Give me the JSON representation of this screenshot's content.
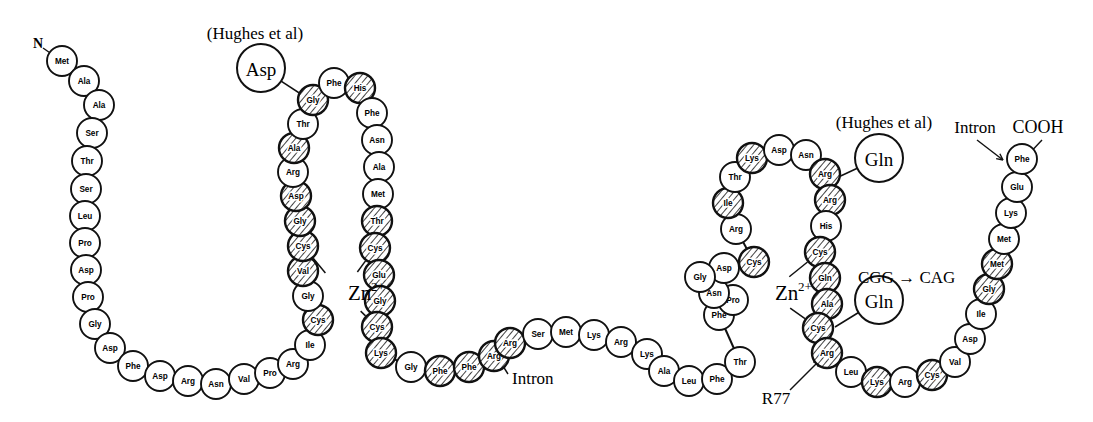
{
  "figure": {
    "colors": {
      "stroke": "#111111",
      "fill_plain": "#ffffff",
      "fill_hatched": "#ffffff",
      "hatch_line": "#111111",
      "text": "#000000"
    },
    "radius_plain": 15,
    "radius_callout": 24
  },
  "terminals": [
    {
      "id": "n-terminus",
      "text": "N",
      "x": 38,
      "y": 43
    },
    {
      "id": "c-terminus",
      "text": "COOH",
      "x": 1038,
      "y": 127
    }
  ],
  "annotations": [
    {
      "id": "hughes-left",
      "text": "(Hughes et al)",
      "x": 255,
      "y": 33,
      "anchor": "middle"
    },
    {
      "id": "hughes-right",
      "text": "(Hughes et al)",
      "x": 884,
      "y": 122,
      "anchor": "middle"
    },
    {
      "id": "zn-left",
      "text": "Zn",
      "sup": "2+",
      "x": 348,
      "y": 293
    },
    {
      "id": "zn-right",
      "text": "Zn",
      "sup": "2+",
      "x": 775,
      "y": 293
    },
    {
      "id": "intron-mid",
      "text": "Intron",
      "x": 512,
      "y": 378,
      "anchor": "start"
    },
    {
      "id": "intron-right",
      "text": "Intron",
      "x": 975,
      "y": 127,
      "anchor": "middle"
    },
    {
      "id": "mutation-cgg-cag",
      "text": "CGG → CAG",
      "x": 858,
      "y": 277,
      "anchor": "start"
    },
    {
      "id": "residue-r77",
      "text": "R77",
      "x": 776,
      "y": 398,
      "anchor": "middle"
    }
  ],
  "callouts": [
    {
      "id": "callout-asp",
      "label": "Asp",
      "x": 261,
      "y": 68,
      "to_x": 310,
      "to_y": 100
    },
    {
      "id": "callout-gln-upper",
      "label": "Gln",
      "x": 879,
      "y": 158,
      "to_x": 832,
      "to_y": 180
    },
    {
      "id": "callout-gln-lower",
      "label": "Gln",
      "x": 879,
      "y": 300,
      "to_x": 835,
      "to_y": 327
    }
  ],
  "chain_name": "zinc-finger-polypeptide",
  "residues": [
    {
      "i": 1,
      "aa": "Met",
      "x": 62,
      "y": 61,
      "hatched": false
    },
    {
      "i": 2,
      "aa": "Ala",
      "x": 84,
      "y": 81,
      "hatched": false
    },
    {
      "i": 3,
      "aa": "Ala",
      "x": 99,
      "y": 105,
      "hatched": false
    },
    {
      "i": 4,
      "aa": "Ser",
      "x": 92,
      "y": 133,
      "hatched": false
    },
    {
      "i": 5,
      "aa": "Thr",
      "x": 87,
      "y": 161,
      "hatched": false
    },
    {
      "i": 6,
      "aa": "Ser",
      "x": 86,
      "y": 189,
      "hatched": false
    },
    {
      "i": 7,
      "aa": "Leu",
      "x": 85,
      "y": 216,
      "hatched": false
    },
    {
      "i": 8,
      "aa": "Pro",
      "x": 85,
      "y": 243,
      "hatched": false
    },
    {
      "i": 9,
      "aa": "Asp",
      "x": 86,
      "y": 270,
      "hatched": false
    },
    {
      "i": 10,
      "aa": "Pro",
      "x": 88,
      "y": 297,
      "hatched": false
    },
    {
      "i": 11,
      "aa": "Gly",
      "x": 95,
      "y": 324,
      "hatched": false
    },
    {
      "i": 12,
      "aa": "Asp",
      "x": 110,
      "y": 348,
      "hatched": false
    },
    {
      "i": 13,
      "aa": "Phe",
      "x": 133,
      "y": 366,
      "hatched": false
    },
    {
      "i": 14,
      "aa": "Asp",
      "x": 160,
      "y": 376,
      "hatched": false
    },
    {
      "i": 15,
      "aa": "Arg",
      "x": 188,
      "y": 381,
      "hatched": false
    },
    {
      "i": 16,
      "aa": "Asn",
      "x": 216,
      "y": 384,
      "hatched": false
    },
    {
      "i": 17,
      "aa": "Val",
      "x": 244,
      "y": 379,
      "hatched": false
    },
    {
      "i": 18,
      "aa": "Pro",
      "x": 270,
      "y": 373,
      "hatched": false
    },
    {
      "i": 19,
      "aa": "Arg",
      "x": 293,
      "y": 364,
      "hatched": false
    },
    {
      "i": 20,
      "aa": "Ile",
      "x": 310,
      "y": 345,
      "hatched": false
    },
    {
      "i": 21,
      "aa": "Cys",
      "x": 318,
      "y": 320,
      "hatched": true
    },
    {
      "i": 22,
      "aa": "Gly",
      "x": 308,
      "y": 296,
      "hatched": false
    },
    {
      "i": 23,
      "aa": "Val",
      "x": 303,
      "y": 271,
      "hatched": true
    },
    {
      "i": 24,
      "aa": "Cys",
      "x": 303,
      "y": 246,
      "hatched": true
    },
    {
      "i": 25,
      "aa": "Gly",
      "x": 300,
      "y": 221,
      "hatched": true
    },
    {
      "i": 26,
      "aa": "Asp",
      "x": 296,
      "y": 196,
      "hatched": true
    },
    {
      "i": 27,
      "aa": "Arg",
      "x": 293,
      "y": 172,
      "hatched": false
    },
    {
      "i": 28,
      "aa": "Ala",
      "x": 294,
      "y": 148,
      "hatched": true
    },
    {
      "i": 29,
      "aa": "Thr",
      "x": 303,
      "y": 124,
      "hatched": false
    },
    {
      "i": 30,
      "aa": "Gly",
      "x": 313,
      "y": 100,
      "hatched": true
    },
    {
      "i": 31,
      "aa": "Phe",
      "x": 334,
      "y": 83,
      "hatched": false
    },
    {
      "i": 32,
      "aa": "His",
      "x": 360,
      "y": 88,
      "hatched": true
    },
    {
      "i": 33,
      "aa": "Phe",
      "x": 372,
      "y": 113,
      "hatched": false
    },
    {
      "i": 34,
      "aa": "Asn",
      "x": 377,
      "y": 140,
      "hatched": false
    },
    {
      "i": 35,
      "aa": "Ala",
      "x": 379,
      "y": 167,
      "hatched": false
    },
    {
      "i": 36,
      "aa": "Met",
      "x": 378,
      "y": 194,
      "hatched": false
    },
    {
      "i": 37,
      "aa": "Thr",
      "x": 377,
      "y": 221,
      "hatched": true
    },
    {
      "i": 38,
      "aa": "Cys",
      "x": 375,
      "y": 248,
      "hatched": true
    },
    {
      "i": 39,
      "aa": "Glu",
      "x": 379,
      "y": 275,
      "hatched": true
    },
    {
      "i": 40,
      "aa": "Gly",
      "x": 380,
      "y": 301,
      "hatched": true
    },
    {
      "i": 41,
      "aa": "Cys",
      "x": 377,
      "y": 327,
      "hatched": true
    },
    {
      "i": 42,
      "aa": "Lys",
      "x": 381,
      "y": 353,
      "hatched": true
    },
    {
      "i": 43,
      "aa": "Gly",
      "x": 411,
      "y": 367,
      "hatched": false
    },
    {
      "i": 44,
      "aa": "Phe",
      "x": 440,
      "y": 371,
      "hatched": true
    },
    {
      "i": 45,
      "aa": "Phe",
      "x": 469,
      "y": 367,
      "hatched": true
    },
    {
      "i": 46,
      "aa": "Arg",
      "x": 494,
      "y": 356,
      "hatched": true
    },
    {
      "i": 47,
      "aa": "Arg",
      "x": 510,
      "y": 343,
      "hatched": true
    },
    {
      "i": 48,
      "aa": "Ser",
      "x": 538,
      "y": 334,
      "hatched": false
    },
    {
      "i": 49,
      "aa": "Met",
      "x": 566,
      "y": 332,
      "hatched": false
    },
    {
      "i": 50,
      "aa": "Lys",
      "x": 594,
      "y": 335,
      "hatched": false
    },
    {
      "i": 51,
      "aa": "Arg",
      "x": 621,
      "y": 342,
      "hatched": false
    },
    {
      "i": 52,
      "aa": "Lys",
      "x": 647,
      "y": 354,
      "hatched": false
    },
    {
      "i": 53,
      "aa": "Ala",
      "x": 664,
      "y": 371,
      "hatched": false
    },
    {
      "i": 54,
      "aa": "Leu",
      "x": 689,
      "y": 381,
      "hatched": false
    },
    {
      "i": 55,
      "aa": "Phe",
      "x": 717,
      "y": 379,
      "hatched": false
    },
    {
      "i": 56,
      "aa": "Thr",
      "x": 740,
      "y": 362,
      "hatched": false
    },
    {
      "i": 57,
      "aa": "Phe",
      "x": 719,
      "y": 315,
      "hatched": false
    },
    {
      "i": 58,
      "aa": "Pro",
      "x": 733,
      "y": 300,
      "hatched": false
    },
    {
      "i": 59,
      "aa": "Asn",
      "x": 714,
      "y": 293,
      "hatched": false
    },
    {
      "i": 60,
      "aa": "Asp",
      "x": 724,
      "y": 268,
      "hatched": false
    },
    {
      "i": 61,
      "aa": "Gly",
      "x": 700,
      "y": 277,
      "hatched": false
    },
    {
      "i": 62,
      "aa": "Cys",
      "x": 754,
      "y": 262,
      "hatched": true
    },
    {
      "i": 63,
      "aa": "Arg",
      "x": 736,
      "y": 229,
      "hatched": false
    },
    {
      "i": 64,
      "aa": "Ile",
      "x": 728,
      "y": 203,
      "hatched": true
    },
    {
      "i": 65,
      "aa": "Thr",
      "x": 735,
      "y": 177,
      "hatched": false
    },
    {
      "i": 66,
      "aa": "Lys",
      "x": 752,
      "y": 158,
      "hatched": true
    },
    {
      "i": 67,
      "aa": "Asp",
      "x": 779,
      "y": 150,
      "hatched": false
    },
    {
      "i": 68,
      "aa": "Asn",
      "x": 806,
      "y": 155,
      "hatched": false
    },
    {
      "i": 69,
      "aa": "Arg",
      "x": 825,
      "y": 174,
      "hatched": true
    },
    {
      "i": 70,
      "aa": "Arg",
      "x": 830,
      "y": 200,
      "hatched": true
    },
    {
      "i": 71,
      "aa": "His",
      "x": 826,
      "y": 226,
      "hatched": false
    },
    {
      "i": 72,
      "aa": "Cys",
      "x": 820,
      "y": 252,
      "hatched": true
    },
    {
      "i": 73,
      "aa": "Gln",
      "x": 825,
      "y": 278,
      "hatched": true
    },
    {
      "i": 74,
      "aa": "Ala",
      "x": 827,
      "y": 304,
      "hatched": true
    },
    {
      "i": 75,
      "aa": "Cys",
      "x": 818,
      "y": 328,
      "hatched": true
    },
    {
      "i": 76,
      "aa": "Arg",
      "x": 827,
      "y": 353,
      "hatched": true
    },
    {
      "i": 77,
      "aa": "Leu",
      "x": 851,
      "y": 372,
      "hatched": false
    },
    {
      "i": 78,
      "aa": "Lys",
      "x": 877,
      "y": 382,
      "hatched": true
    },
    {
      "i": 79,
      "aa": "Arg",
      "x": 905,
      "y": 382,
      "hatched": false
    },
    {
      "i": 80,
      "aa": "Cys",
      "x": 932,
      "y": 375,
      "hatched": true
    },
    {
      "i": 81,
      "aa": "Val",
      "x": 955,
      "y": 362,
      "hatched": false
    },
    {
      "i": 82,
      "aa": "Asp",
      "x": 970,
      "y": 339,
      "hatched": false
    },
    {
      "i": 83,
      "aa": "Ile",
      "x": 981,
      "y": 314,
      "hatched": false
    },
    {
      "i": 84,
      "aa": "Gly",
      "x": 989,
      "y": 289,
      "hatched": true
    },
    {
      "i": 85,
      "aa": "Met",
      "x": 997,
      "y": 264,
      "hatched": true
    },
    {
      "i": 86,
      "aa": "Met",
      "x": 1004,
      "y": 239,
      "hatched": false
    },
    {
      "i": 87,
      "aa": "Lys",
      "x": 1011,
      "y": 213,
      "hatched": false
    },
    {
      "i": 88,
      "aa": "Glu",
      "x": 1017,
      "y": 187,
      "hatched": false
    },
    {
      "i": 89,
      "aa": "Phe",
      "x": 1022,
      "y": 159,
      "hatched": false
    }
  ],
  "zinc_bonds": [
    {
      "id": "zn-left-b1",
      "from": 21,
      "to": "zn-left"
    },
    {
      "id": "zn-left-b2",
      "from": 24,
      "to": "zn-left"
    },
    {
      "id": "zn-left-b3",
      "from": 38,
      "to": "zn-left"
    },
    {
      "id": "zn-left-b4",
      "from": 41,
      "to": "zn-left"
    },
    {
      "id": "zn-right-b1",
      "from": 62,
      "to": "zn-right"
    },
    {
      "id": "zn-right-b2",
      "from": 72,
      "to": "zn-right"
    },
    {
      "id": "zn-right-b3",
      "from": 75,
      "to": "zn-right"
    }
  ],
  "pointer_lines": [
    {
      "id": "ptr-intron-mid",
      "x1": 508,
      "y1": 374,
      "x2": 494,
      "y2": 352
    },
    {
      "id": "ptr-intron-right",
      "x1": 977,
      "y1": 140,
      "x2": 1003,
      "y2": 160
    },
    {
      "id": "ptr-cooh",
      "x1": 1042,
      "y1": 140,
      "x2": 1026,
      "y2": 157
    },
    {
      "id": "ptr-r77",
      "x1": 790,
      "y1": 390,
      "x2": 820,
      "y2": 360
    },
    {
      "id": "ptr-n-term",
      "x1": 43,
      "y1": 48,
      "x2": 56,
      "y2": 57
    }
  ]
}
